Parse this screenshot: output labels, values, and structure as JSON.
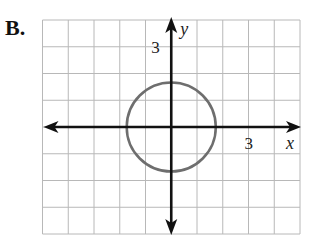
{
  "option_label": "B.",
  "chart_data": {
    "type": "diagram",
    "title": "",
    "xlabel": "x",
    "ylabel": "y",
    "xlim": [
      -5,
      5
    ],
    "ylim": [
      -4,
      4
    ],
    "grid": true,
    "tick_labels": {
      "x": "3",
      "y": "3"
    },
    "curve": {
      "shape": "circle",
      "center": [
        0,
        0
      ],
      "radius": 1.73,
      "equation": "x^2 + y^2 = 3",
      "color": "#6e6e6e"
    },
    "colors": {
      "grid": "#b8b8b8",
      "axes": "#111111",
      "curve": "#6e6e6e"
    }
  }
}
